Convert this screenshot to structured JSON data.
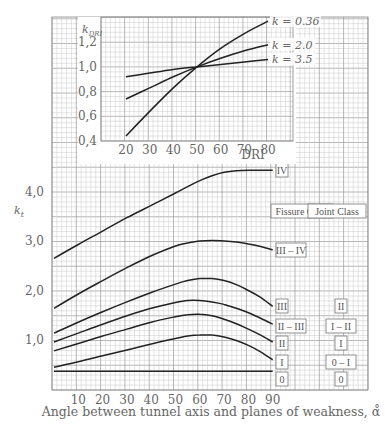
{
  "chart_data": [
    {
      "type": "line",
      "title": "",
      "xlabel": "Angle between tunnel axis and planes of weakness, α̊",
      "ylabel": "k_t",
      "xlim": [
        0,
        90
      ],
      "ylim": [
        0,
        4.5
      ],
      "xticks": [
        10,
        20,
        30,
        40,
        50,
        60,
        70,
        80,
        90
      ],
      "yticks": [
        "1,0",
        "2,0",
        "3,0",
        "4,0"
      ],
      "ytick_values": [
        1.0,
        2.0,
        3.0,
        4.0
      ],
      "grid": true,
      "legend_headers": [
        "Fissure Class",
        "Joint Class"
      ],
      "x": [
        0,
        10,
        20,
        30,
        40,
        50,
        55,
        60,
        65,
        70,
        75,
        80,
        85,
        90
      ],
      "series": [
        {
          "name": "IV",
          "fissure_class": "IV",
          "joint_class": "",
          "values": [
            2.65,
            2.93,
            3.2,
            3.47,
            3.72,
            3.97,
            4.1,
            4.22,
            4.32,
            4.39,
            4.42,
            4.43,
            4.43,
            4.43
          ]
        },
        {
          "name": "III – IV",
          "fissure_class": "III – IV",
          "joint_class": "",
          "values": [
            1.64,
            1.93,
            2.2,
            2.46,
            2.7,
            2.9,
            2.96,
            3.0,
            3.01,
            3.0,
            2.98,
            2.94,
            2.89,
            2.82
          ]
        },
        {
          "name": "III",
          "fissure_class": "III",
          "joint_class": "II",
          "values": [
            1.14,
            1.36,
            1.57,
            1.77,
            1.96,
            2.13,
            2.2,
            2.24,
            2.24,
            2.2,
            2.12,
            2.0,
            1.86,
            1.68
          ]
        },
        {
          "name": "II – III",
          "fissure_class": "II – III",
          "joint_class": "I – II",
          "values": [
            0.96,
            1.14,
            1.32,
            1.49,
            1.64,
            1.76,
            1.8,
            1.8,
            1.77,
            1.72,
            1.64,
            1.55,
            1.44,
            1.32
          ]
        },
        {
          "name": "II",
          "fissure_class": "II",
          "joint_class": "I",
          "values": [
            0.78,
            0.93,
            1.08,
            1.22,
            1.36,
            1.47,
            1.51,
            1.52,
            1.49,
            1.42,
            1.33,
            1.22,
            1.1,
            0.96
          ]
        },
        {
          "name": "I",
          "fissure_class": "I",
          "joint_class": "0 – I",
          "values": [
            0.45,
            0.56,
            0.68,
            0.8,
            0.92,
            1.03,
            1.08,
            1.1,
            1.1,
            1.06,
            0.99,
            0.89,
            0.76,
            0.6
          ]
        },
        {
          "name": "0",
          "fissure_class": "0",
          "joint_class": "0",
          "values": [
            0.37,
            0.37,
            0.37,
            0.37,
            0.37,
            0.37,
            0.37,
            0.37,
            0.37,
            0.37,
            0.37,
            0.37,
            0.37,
            0.37
          ]
        }
      ]
    },
    {
      "type": "line",
      "title": "",
      "xlabel": "DRI",
      "ylabel": "k_DRI",
      "xlim": [
        10,
        85
      ],
      "ylim": [
        0.4,
        1.4
      ],
      "xticks": [
        20,
        30,
        40,
        50,
        60,
        70,
        80
      ],
      "yticks": [
        "0,4",
        "0,6",
        "0,8",
        "1,0",
        "1,2"
      ],
      "ytick_values": [
        0.4,
        0.6,
        0.8,
        1.0,
        1.2
      ],
      "grid": true,
      "x": [
        20,
        30,
        40,
        50,
        60,
        70,
        80
      ],
      "series": [
        {
          "name": "k_t = 0.36",
          "label": "k = 0.36",
          "values": [
            0.44,
            0.64,
            0.83,
            1.0,
            1.15,
            1.27,
            1.37
          ]
        },
        {
          "name": "k_t = 2.0",
          "label": "k = 2.0",
          "values": [
            0.74,
            0.83,
            0.92,
            1.0,
            1.07,
            1.13,
            1.18
          ]
        },
        {
          "name": "k_t = 3.5",
          "label": "k = 3.5",
          "values": [
            0.92,
            0.95,
            0.98,
            1.0,
            1.02,
            1.04,
            1.06
          ]
        }
      ]
    }
  ],
  "labels": {
    "main_ylabel_main": "k",
    "main_ylabel_sub": "t",
    "main_xlabel": "Angle between tunnel axis and planes of weakness, α̊",
    "inset_ylabel_main": "k",
    "inset_ylabel_sub": "DRI",
    "inset_xlabel": "DRI",
    "fissure_header": "Fissure Class",
    "joint_header": "Joint Class"
  },
  "colors": {
    "grid_minor": "#c8c8c8",
    "grid_major": "#9a9a9a",
    "curve": "#222222",
    "text": "#666666"
  }
}
